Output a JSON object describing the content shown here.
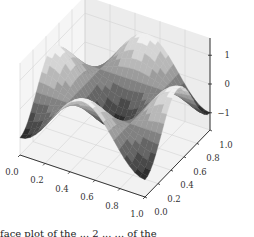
{
  "chart_data": {
    "type": "surface3d",
    "title": "",
    "function_hint": "z = sin(2*pi*x) * sin(2*pi*y) style periodic surface",
    "x": {
      "label": "",
      "range": [
        0.0,
        1.0
      ],
      "ticks": [
        "0.0",
        "0.2",
        "0.4",
        "0.6",
        "0.8",
        "1.0"
      ]
    },
    "y": {
      "label": "",
      "range": [
        0.0,
        1.0
      ],
      "ticks": [
        "0.0",
        "0.2",
        "0.4",
        "0.6",
        "0.8",
        "1.0"
      ]
    },
    "z": {
      "label": "",
      "range": [
        -1.6,
        1.6
      ],
      "ticks": [
        "-1",
        "0",
        "1"
      ],
      "tick_values": [
        -1,
        0,
        1
      ]
    },
    "grid": true,
    "colormap": "grayscale",
    "resolution": 24,
    "amplitude": 1.0,
    "frequency": 1.0
  },
  "caption": {
    "text": "face plot of the ... 2 ... ... of the"
  }
}
